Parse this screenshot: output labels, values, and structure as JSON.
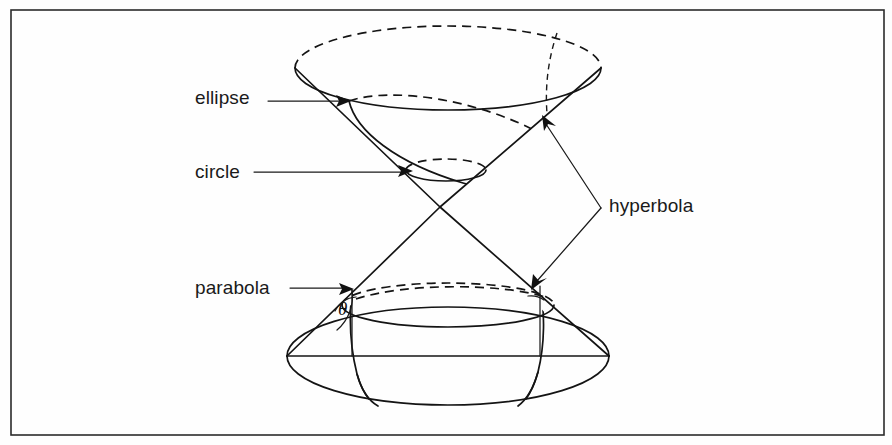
{
  "figure": {
    "border_color": "#2b2b2b",
    "ink_color": "#141414",
    "background_color": "#fefefe"
  },
  "labels": {
    "ellipse": "ellipse",
    "circle": "circle",
    "parabola": "parabola",
    "hyperbola": "hyperbola",
    "angle_symbol": "θ"
  },
  "annotations": [
    {
      "name": "ellipse",
      "text": "ellipse",
      "leader": "horizontal-arrow-right",
      "text_x": 195,
      "text_y": 104,
      "arrow_tip_x": 349,
      "arrow_tip_y": 101
    },
    {
      "name": "circle",
      "text": "circle",
      "leader": "horizontal-arrow-right",
      "text_x": 195,
      "text_y": 178,
      "arrow_tip_x": 411,
      "arrow_tip_y": 171
    },
    {
      "name": "parabola",
      "text": "parabola",
      "leader": "horizontal-arrow-right",
      "text_x": 195,
      "text_y": 294,
      "arrow_tip_x": 352,
      "arrow_tip_y": 290
    },
    {
      "name": "hyperbola",
      "text": "hyperbola",
      "leader": "v-bracket-two-arrows",
      "text_x": 609,
      "text_y": 212,
      "arrow_tip_x": 546,
      "arrow_tip_y": 122
    }
  ],
  "geometry": {
    "apex": {
      "x": 440,
      "y": 207
    },
    "upper_cone_rim": {
      "cx": 448,
      "cy": 68,
      "rx": 153,
      "ry": 42
    },
    "lower_cone_rim": {
      "cx": 448,
      "cy": 305,
      "rx": 106,
      "ry": 22
    },
    "lower_cone_base": {
      "cx": 448,
      "cy": 356,
      "rx": 161,
      "ry": 49
    },
    "circle_section": {
      "cx": 446,
      "cy": 170,
      "rx": 40,
      "ry": 11
    },
    "ellipse_section": {
      "p1_x": 349,
      "p1_y": 101,
      "p2_x": 573,
      "p2_y": 191
    },
    "frame": {
      "x": 11,
      "y": 10,
      "width": 873,
      "height": 425
    }
  }
}
